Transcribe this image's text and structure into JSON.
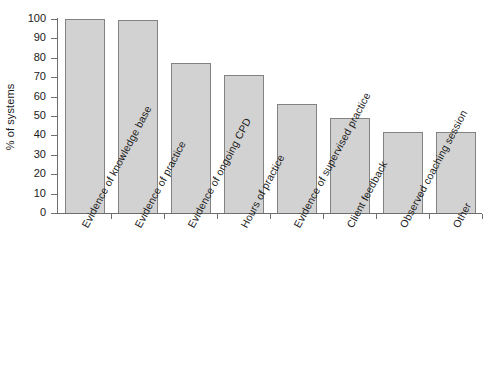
{
  "chart_data": {
    "type": "bar",
    "title": "",
    "subtitle": "",
    "xlabel": "",
    "ylabel": "% of systems",
    "ylim": [
      0,
      100
    ],
    "ytick_labels": [
      "0",
      "10",
      "20",
      "30",
      "40",
      "50",
      "60",
      "70",
      "80",
      "90",
      "100"
    ],
    "yticks": [
      0,
      10,
      20,
      30,
      40,
      50,
      60,
      70,
      80,
      90,
      100
    ],
    "grid": false,
    "legend": null,
    "legend_position": "none",
    "bar_fill_color": "#d2d2d2",
    "bar_border_color": "#828282",
    "axis_color": "#6e6e6e",
    "text_color": "#1a1a1a",
    "categories": [
      "Evidence of knowledge base",
      "Evidence of practice",
      "Evidence of ongoing CPD",
      "Hours of practice",
      "Evidence of supervised practice",
      "Client feedback",
      "Observed coaching session",
      "Other"
    ],
    "values": [
      100,
      99.5,
      77.5,
      71,
      56,
      49,
      41.5,
      41.5
    ]
  }
}
